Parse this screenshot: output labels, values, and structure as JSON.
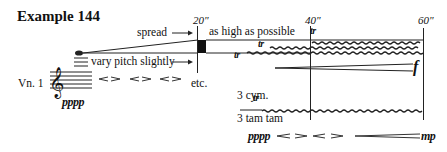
{
  "title": "Example 144",
  "timeline": {
    "markers": [
      "20\"",
      "40\"",
      "60\""
    ]
  },
  "instrument": {
    "label": "Vn. 1",
    "dynamic": "pppp"
  },
  "directions": {
    "spread": "spread",
    "vary_pitch": "vary pitch slightly",
    "as_high": "as high as possible",
    "hairpins_etc": "etc.",
    "trill": "tr",
    "forte": "f"
  },
  "percussion": {
    "cymbals": "3 cym.",
    "tam_tam": "3 tam tam",
    "dynamic_start": "pppp",
    "dynamic_end": "mp"
  }
}
